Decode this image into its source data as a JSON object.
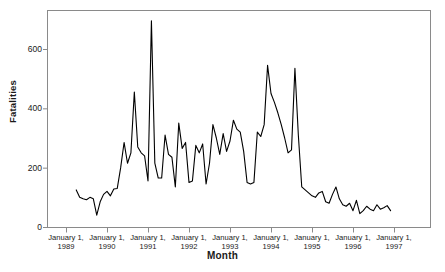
{
  "chart_data": {
    "type": "line",
    "title": "",
    "xlabel": "Month",
    "ylabel": "Fatalities",
    "ylim": [
      0,
      720
    ],
    "yticks": [
      0,
      200,
      400,
      600
    ],
    "ytick_labels": [
      "0",
      "200",
      "400",
      "600"
    ],
    "xtick_labels": [
      {
        "line1": "January 1,",
        "line2": "1989"
      },
      {
        "line1": "January 1,",
        "line2": "1990"
      },
      {
        "line1": "January 1,",
        "line2": "1991"
      },
      {
        "line1": "January 1,",
        "line2": "1992"
      },
      {
        "line1": "January 1,",
        "line2": "1993"
      },
      {
        "line1": "January 1,",
        "line2": "1994"
      },
      {
        "line1": "January 1,",
        "line2": "1995"
      },
      {
        "line1": "January 1,",
        "line2": "1996"
      },
      {
        "line1": "January 1,",
        "line2": "1997"
      }
    ],
    "grid": false,
    "legend": false,
    "line_color": "#000000",
    "frame_color": "#8a8a8a",
    "x_start_month": "1989-04",
    "x_unit": "month",
    "series": [
      {
        "name": "Fatalities",
        "x": [
          "1989-04",
          "1989-05",
          "1989-06",
          "1989-07",
          "1989-08",
          "1989-09",
          "1989-10",
          "1989-11",
          "1989-12",
          "1990-01",
          "1990-02",
          "1990-03",
          "1990-04",
          "1990-05",
          "1990-06",
          "1990-07",
          "1990-08",
          "1990-09",
          "1990-10",
          "1990-11",
          "1990-12",
          "1991-01",
          "1991-02",
          "1991-03",
          "1991-04",
          "1991-05",
          "1991-06",
          "1991-07",
          "1991-08",
          "1991-09",
          "1991-10",
          "1991-11",
          "1991-12",
          "1992-01",
          "1992-02",
          "1992-03",
          "1992-04",
          "1992-05",
          "1992-06",
          "1992-07",
          "1992-08",
          "1992-09",
          "1992-10",
          "1992-11",
          "1992-12",
          "1993-01",
          "1993-02",
          "1993-03",
          "1993-04",
          "1993-05",
          "1993-06",
          "1993-07",
          "1993-08",
          "1993-09",
          "1993-10",
          "1993-11",
          "1993-12",
          "1994-01",
          "1994-02",
          "1994-03",
          "1994-04",
          "1994-05",
          "1994-06",
          "1994-07",
          "1994-08",
          "1994-09",
          "1994-10",
          "1994-11",
          "1994-12",
          "1995-01",
          "1995-02",
          "1995-03",
          "1995-04",
          "1995-05",
          "1995-06",
          "1995-07",
          "1995-08",
          "1995-09",
          "1995-10",
          "1995-11",
          "1995-12",
          "1996-01",
          "1996-02",
          "1996-03",
          "1996-04",
          "1996-05",
          "1996-06",
          "1996-07",
          "1996-08",
          "1996-09",
          "1996-10",
          "1996-11",
          "1996-12"
        ],
        "values": [
          125,
          100,
          95,
          92,
          100,
          95,
          40,
          85,
          110,
          120,
          105,
          128,
          130,
          200,
          285,
          215,
          250,
          455,
          270,
          250,
          240,
          155,
          695,
          215,
          165,
          165,
          310,
          245,
          235,
          135,
          350,
          265,
          285,
          150,
          155,
          275,
          250,
          280,
          145,
          215,
          345,
          300,
          245,
          315,
          255,
          290,
          360,
          330,
          320,
          255,
          150,
          145,
          150,
          320,
          305,
          345,
          545,
          450,
          420,
          385,
          345,
          300,
          250,
          260,
          535,
          310,
          135,
          125,
          115,
          105,
          100,
          115,
          120,
          85,
          80,
          110,
          135,
          95,
          75,
          70,
          80,
          55,
          90,
          45,
          55,
          70,
          60,
          55,
          75,
          60,
          65,
          72,
          55
        ]
      }
    ]
  }
}
